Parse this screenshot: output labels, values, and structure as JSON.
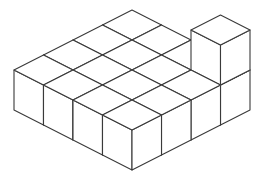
{
  "figure": {
    "background_color": "#ffffff",
    "line_color": "#3a3a3a",
    "fill_color": "#ffffff",
    "line_width": 1.1,
    "canvas": {
      "width": 258,
      "height": 185
    }
  },
  "projection": {
    "type": "isometric",
    "origin_x": 132,
    "origin_y": 50,
    "step_x": 29.5,
    "step_y": 15.0,
    "cube_height": 40,
    "grid_columns": 4,
    "grid_rows": 4
  },
  "structure": {
    "base_layer_label": "base slab",
    "base_layer_cubes": 16,
    "stacked_cubes": 1,
    "total_cubes": 17,
    "stacked_cube_position": {
      "col": 3,
      "row": 0,
      "level": 1
    },
    "cells": [
      {
        "col": 0,
        "row": 0,
        "height": 1
      },
      {
        "col": 1,
        "row": 0,
        "height": 1
      },
      {
        "col": 2,
        "row": 0,
        "height": 1
      },
      {
        "col": 3,
        "row": 0,
        "height": 2
      },
      {
        "col": 0,
        "row": 1,
        "height": 1
      },
      {
        "col": 1,
        "row": 1,
        "height": 1
      },
      {
        "col": 2,
        "row": 1,
        "height": 1
      },
      {
        "col": 3,
        "row": 1,
        "height": 1
      },
      {
        "col": 0,
        "row": 2,
        "height": 1
      },
      {
        "col": 1,
        "row": 2,
        "height": 1
      },
      {
        "col": 2,
        "row": 2,
        "height": 1
      },
      {
        "col": 3,
        "row": 2,
        "height": 1
      },
      {
        "col": 0,
        "row": 3,
        "height": 1
      },
      {
        "col": 1,
        "row": 3,
        "height": 1
      },
      {
        "col": 2,
        "row": 3,
        "height": 1
      },
      {
        "col": 3,
        "row": 3,
        "height": 1
      }
    ]
  }
}
